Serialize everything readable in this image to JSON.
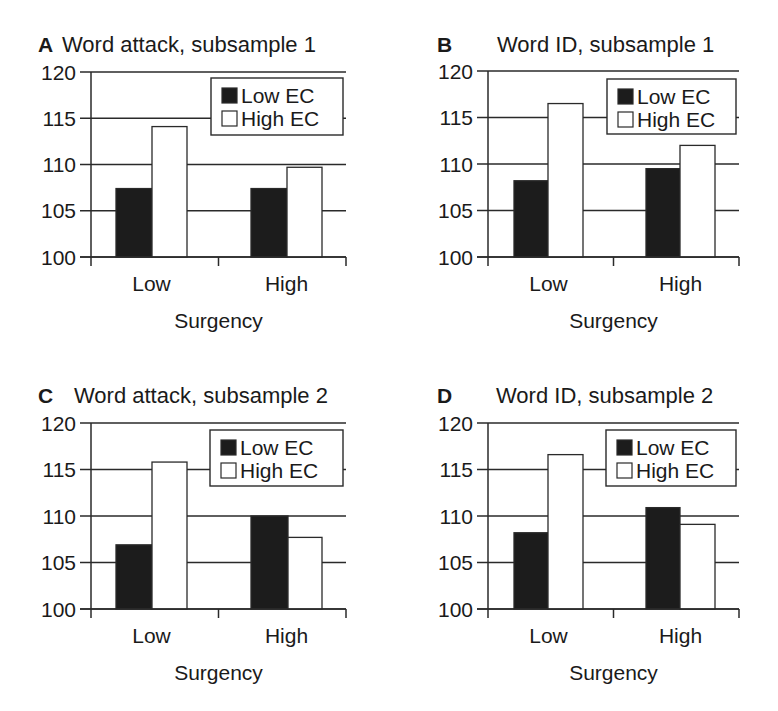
{
  "figure": {
    "legend": {
      "entries": [
        {
          "label": "Low EC",
          "fill": "#1c1c1c"
        },
        {
          "label": "High EC",
          "fill": "#ffffff"
        }
      ]
    },
    "colors": {
      "low_ec": "#1c1c1c",
      "high_ec": "#ffffff",
      "line": "#2a2a2a"
    }
  },
  "chart_data": [
    {
      "type": "bar",
      "panel": "A",
      "title": "Word attack, subsample 1",
      "xlabel": "Surgency",
      "ylabel": "",
      "categories": [
        "Low",
        "High"
      ],
      "yticks": [
        100,
        105,
        110,
        115,
        120
      ],
      "ylim": [
        100,
        120
      ],
      "grid": true,
      "legend_position": "top-right",
      "series": [
        {
          "name": "Low EC",
          "values": [
            107.4,
            107.4
          ]
        },
        {
          "name": "High EC",
          "values": [
            114.1,
            109.7
          ]
        }
      ]
    },
    {
      "type": "bar",
      "panel": "B",
      "title": "Word ID, subsample 1",
      "xlabel": "Surgency",
      "ylabel": "",
      "categories": [
        "Low",
        "High"
      ],
      "yticks": [
        100,
        105,
        110,
        115,
        120
      ],
      "ylim": [
        100,
        120
      ],
      "grid": true,
      "legend_position": "top-right",
      "series": [
        {
          "name": "Low EC",
          "values": [
            108.2,
            109.5
          ]
        },
        {
          "name": "High EC",
          "values": [
            116.5,
            112.0
          ]
        }
      ]
    },
    {
      "type": "bar",
      "panel": "C",
      "title": "Word attack, subsample 2",
      "xlabel": "Surgency",
      "ylabel": "",
      "categories": [
        "Low",
        "High"
      ],
      "yticks": [
        100,
        105,
        110,
        115,
        120
      ],
      "ylim": [
        100,
        120
      ],
      "grid": true,
      "legend_position": "top-right",
      "series": [
        {
          "name": "Low EC",
          "values": [
            106.9,
            110.0
          ]
        },
        {
          "name": "High EC",
          "values": [
            115.8,
            107.7
          ]
        }
      ]
    },
    {
      "type": "bar",
      "panel": "D",
      "title": "Word ID, subsample 2",
      "xlabel": "Surgency",
      "ylabel": "",
      "categories": [
        "Low",
        "High"
      ],
      "yticks": [
        100,
        105,
        110,
        115,
        120
      ],
      "ylim": [
        100,
        120
      ],
      "grid": true,
      "legend_position": "top-right",
      "series": [
        {
          "name": "Low EC",
          "values": [
            108.2,
            110.9
          ]
        },
        {
          "name": "High EC",
          "values": [
            116.6,
            109.1
          ]
        }
      ]
    }
  ]
}
